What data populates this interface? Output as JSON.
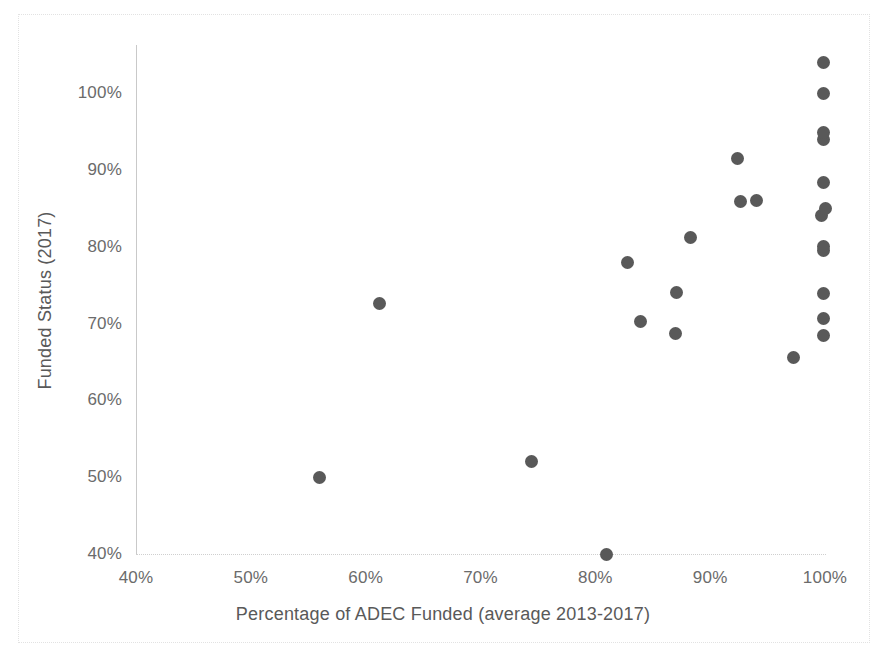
{
  "chart_data": {
    "type": "scatter",
    "title": "",
    "xlabel": "Percentage of ADEC Funded (average 2013-2017)",
    "ylabel": "Funded Status (2017)",
    "xlim": [
      40,
      100
    ],
    "ylim": [
      40,
      104
    ],
    "x_ticks": [
      "40%",
      "50%",
      "60%",
      "70%",
      "80%",
      "90%",
      "100%"
    ],
    "x_tick_values": [
      40,
      50,
      60,
      70,
      80,
      90,
      100
    ],
    "y_ticks": [
      "40%",
      "50%",
      "60%",
      "70%",
      "80%",
      "90%",
      "100%"
    ],
    "y_tick_values": [
      40,
      50,
      60,
      70,
      80,
      90,
      100
    ],
    "grid": false,
    "legend": "none",
    "marker_color": "#595959",
    "marker_shape": "circle",
    "points": [
      {
        "x": 56.0,
        "y": 49.9
      },
      {
        "x": 61.2,
        "y": 72.6
      },
      {
        "x": 74.4,
        "y": 52.0
      },
      {
        "x": 81.0,
        "y": 40.0
      },
      {
        "x": 82.8,
        "y": 78.0
      },
      {
        "x": 83.9,
        "y": 70.2
      },
      {
        "x": 87.0,
        "y": 68.7
      },
      {
        "x": 87.1,
        "y": 74.0
      },
      {
        "x": 88.3,
        "y": 81.2
      },
      {
        "x": 92.4,
        "y": 91.5
      },
      {
        "x": 92.6,
        "y": 85.9
      },
      {
        "x": 94.0,
        "y": 86.0
      },
      {
        "x": 97.3,
        "y": 65.6
      },
      {
        "x": 99.9,
        "y": 68.4
      },
      {
        "x": 99.9,
        "y": 70.6
      },
      {
        "x": 99.9,
        "y": 73.9
      },
      {
        "x": 99.9,
        "y": 79.5
      },
      {
        "x": 99.9,
        "y": 80.0
      },
      {
        "x": 99.7,
        "y": 84.1
      },
      {
        "x": 100.0,
        "y": 85.0
      },
      {
        "x": 99.9,
        "y": 88.4
      },
      {
        "x": 99.9,
        "y": 94.0
      },
      {
        "x": 99.9,
        "y": 94.8
      },
      {
        "x": 99.9,
        "y": 100.0
      },
      {
        "x": 99.9,
        "y": 104.0
      }
    ]
  }
}
